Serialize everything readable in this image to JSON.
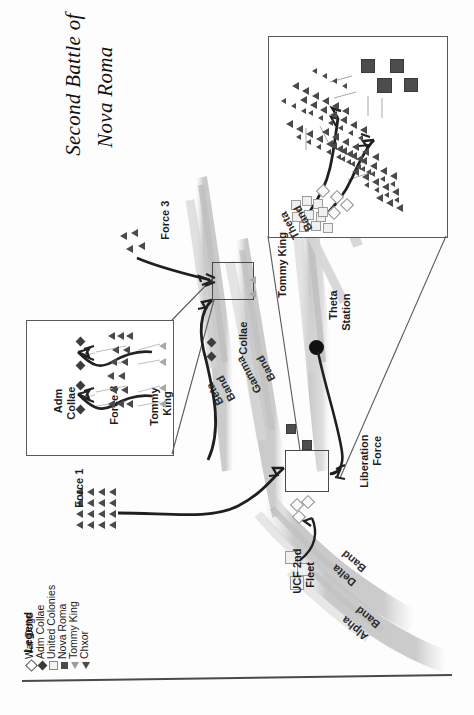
{
  "page": {
    "title_line1": "Second Battle of",
    "title_line2": "Nova Roma",
    "orientation": "rotated-90-ccw"
  },
  "legend": {
    "heading": "Legend",
    "items": [
      {
        "symbol": "open-diamond",
        "label": "War Dogs"
      },
      {
        "symbol": "filled-diamond",
        "label": "Adm Collae"
      },
      {
        "symbol": "open-square",
        "label": "United Colonies"
      },
      {
        "symbol": "filled-square",
        "label": "Nova Roma"
      },
      {
        "symbol": "open-triangle",
        "label": "Tommy King"
      },
      {
        "symbol": "filled-triangle",
        "label": "Chxor"
      }
    ]
  },
  "map": {
    "force_labels": [
      {
        "id": "force-1",
        "text": "Force 1"
      },
      {
        "id": "force-3",
        "text": "Force 3"
      },
      {
        "id": "tommy-king",
        "text": "Tommy King"
      },
      {
        "id": "collae",
        "text": "Collae"
      },
      {
        "id": "theta-station-l1",
        "text": "Theta"
      },
      {
        "id": "theta-station-l2",
        "text": "Station"
      },
      {
        "id": "liberation-force-l1",
        "text": "Liberation"
      },
      {
        "id": "liberation-force-l2",
        "text": "Force"
      },
      {
        "id": "ucf-fleet-l1",
        "text": "UCF 2nd"
      },
      {
        "id": "ucf-fleet-l2",
        "text": "Fleet"
      }
    ],
    "bands": [
      {
        "id": "alpha-band-l1",
        "text": "Alpha"
      },
      {
        "id": "alpha-band-l2",
        "text": "Band"
      },
      {
        "id": "beta-band-l1",
        "text": "Beta"
      },
      {
        "id": "beta-band-l2",
        "text": "Band"
      },
      {
        "id": "gamma-band-l1",
        "text": "Gamma"
      },
      {
        "id": "gamma-band-l2",
        "text": "Band"
      },
      {
        "id": "delta-band-l1",
        "text": "Delta"
      },
      {
        "id": "delta-band-l2",
        "text": "Band"
      },
      {
        "id": "theta-band-l1",
        "text": "Theta"
      },
      {
        "id": "theta-band-l2",
        "text": "Band"
      }
    ]
  },
  "inset_left": {
    "labels": [
      {
        "id": "adm-collae-l1",
        "text": "Adm"
      },
      {
        "id": "adm-collae-l2",
        "text": "Collae"
      },
      {
        "id": "force-3",
        "text": "Force 3"
      },
      {
        "id": "tommy-king-l1",
        "text": "Tommy"
      },
      {
        "id": "tommy-king-l2",
        "text": "King"
      }
    ]
  },
  "inset_right": {
    "labels": []
  },
  "colors": {
    "ink": "#1a1a1a",
    "marker_dark": "#4a4a4a",
    "marker_light": "#9b9b9b",
    "band_gray": "#c9c9c9",
    "arrow": "#2b2b2b",
    "paper": "#fdfdfd"
  }
}
